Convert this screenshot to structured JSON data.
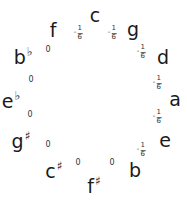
{
  "diagram": {
    "notes": [
      {
        "name": "c",
        "accidental": "",
        "x": 95,
        "y": 15
      },
      {
        "name": "g",
        "accidental": "",
        "x": 133,
        "y": 29
      },
      {
        "name": "d",
        "accidental": "",
        "x": 163,
        "y": 57
      },
      {
        "name": "a",
        "accidental": "",
        "x": 175,
        "y": 99
      },
      {
        "name": "e",
        "accidental": "",
        "x": 165,
        "y": 140
      },
      {
        "name": "b",
        "accidental": "",
        "x": 135,
        "y": 170
      },
      {
        "name": "f",
        "accidental": "♯",
        "x": 94,
        "y": 185
      },
      {
        "name": "c",
        "accidental": "♯",
        "x": 54,
        "y": 170
      },
      {
        "name": "g",
        "accidental": "♯",
        "x": 21,
        "y": 140
      },
      {
        "name": "e",
        "accidental": "♭",
        "x": 11,
        "y": 100
      },
      {
        "name": "b",
        "accidental": "♭",
        "x": 23,
        "y": 56
      },
      {
        "name": "f",
        "accidental": "",
        "x": 53,
        "y": 30
      }
    ],
    "intervals": [
      {
        "between": "c-g",
        "label": "-1/6",
        "minus": "-",
        "num": "1",
        "den": "6",
        "type": "frac",
        "x": 112,
        "y": 33
      },
      {
        "between": "g-d",
        "label": "-1/6",
        "minus": "-",
        "num": "1",
        "den": "6",
        "type": "frac",
        "x": 141,
        "y": 52
      },
      {
        "between": "d-a",
        "label": "-1/6",
        "minus": "-",
        "num": "1",
        "den": "6",
        "type": "frac",
        "x": 157,
        "y": 83
      },
      {
        "between": "a-e",
        "label": "-1/6",
        "minus": "-",
        "num": "1",
        "den": "6",
        "type": "frac",
        "x": 157,
        "y": 117
      },
      {
        "between": "e-b",
        "label": "-1/6",
        "minus": "-",
        "num": "1",
        "den": "6",
        "type": "frac",
        "x": 141,
        "y": 150
      },
      {
        "between": "b-f#",
        "label": "0",
        "type": "zero",
        "x": 112,
        "y": 163
      },
      {
        "between": "f#-c#",
        "label": "0",
        "type": "zero",
        "x": 78,
        "y": 163
      },
      {
        "between": "c#-g#",
        "label": "0",
        "type": "zero",
        "x": 48,
        "y": 145
      },
      {
        "between": "g#-eb",
        "label": "0",
        "type": "zero",
        "x": 30,
        "y": 115
      },
      {
        "between": "eb-bb",
        "label": "0",
        "type": "zero",
        "x": 31,
        "y": 80
      },
      {
        "between": "bb-f",
        "label": "0",
        "type": "zero",
        "x": 48,
        "y": 50
      },
      {
        "between": "f-c",
        "label": "-1/6",
        "minus": "-",
        "num": "1",
        "den": "6",
        "type": "frac",
        "x": 78,
        "y": 33
      }
    ]
  }
}
